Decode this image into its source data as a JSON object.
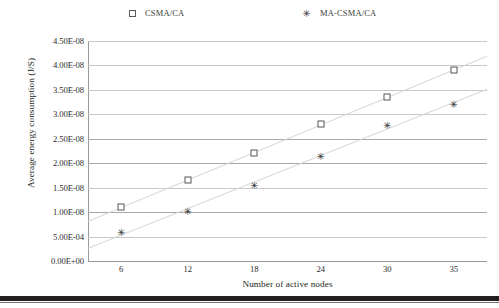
{
  "chart_data": {
    "type": "scatter",
    "title": "",
    "xlabel": "Number of active nodes",
    "ylabel": "Average energy consumption (J/S)",
    "categories": [
      "6",
      "12",
      "18",
      "24",
      "30",
      "35"
    ],
    "x": [
      6,
      12,
      18,
      24,
      30,
      35
    ],
    "xtick_labels": [
      "6",
      "12",
      "18",
      "24",
      "30",
      "35"
    ],
    "ytick_labels": [
      "4.50E-08",
      "4.00E-08",
      "3.50E-08",
      "3.00E-08",
      "2.50E-08",
      "2.00E-08",
      "1.50E-08",
      "1.00E-08",
      "5.00E-04",
      "0.00E+00"
    ],
    "ytick_values": [
      4.5e-08,
      4e-08,
      3.5e-08,
      3e-08,
      2.5e-08,
      2e-08,
      1.5e-08,
      1e-08,
      5e-09,
      0
    ],
    "ylim": [
      0,
      4.5e-08
    ],
    "grid": "horizontal",
    "legend_position": "top",
    "series": [
      {
        "name": "CSMA/CA",
        "marker": "open-square",
        "values": [
          1.1e-08,
          1.65e-08,
          2.2e-08,
          2.8e-08,
          3.35e-08,
          3.9e-08
        ],
        "value_labels": [
          "1.10E-08",
          "1.65E-08",
          "2.20E-08",
          "2.80E-08",
          "3.35E-08",
          "3.90E-08"
        ],
        "trendline": true
      },
      {
        "name": "MA-CSMA/CA",
        "marker": "star",
        "values": [
          6e-09,
          1.02e-08,
          1.55e-08,
          2.15e-08,
          2.78e-08,
          3.22e-08
        ],
        "value_labels": [
          "6.00E-09",
          "1.02E-08",
          "1.55E-08",
          "2.15E-08",
          "2.78E-08",
          "3.22E-08"
        ],
        "trendline": true
      }
    ]
  },
  "legend": {
    "entries": [
      {
        "label": "CSMA/CA",
        "marker": "open-square-marker",
        "glyph": ""
      },
      {
        "label": "MA-CSMA/CA",
        "marker": "star-marker",
        "glyph": "✳"
      }
    ]
  },
  "markers": {
    "star_glyph": "✳"
  },
  "colors": {
    "marker_square_stroke": "#555555",
    "marker_star": "#333333",
    "gridline": "#c9c9c9",
    "axis": "#9a9a9a",
    "text": "#231f20",
    "trendline": "#d9d9d9"
  }
}
